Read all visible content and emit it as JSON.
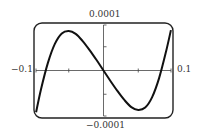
{
  "chart_data": {
    "type": "line",
    "title": "",
    "xlabel": "",
    "ylabel": "",
    "xlim": [
      -0.1,
      0.1
    ],
    "ylim": [
      -0.0001,
      0.0001
    ],
    "x_tick_labels": {
      "min": "−0.1",
      "max": "0.1"
    },
    "y_tick_labels": {
      "max": "0.0001",
      "min": "−0.0001"
    },
    "x_ticks": [
      -0.05,
      0.05
    ],
    "y_ticks": [
      -5e-05,
      5e-05
    ],
    "grid": false,
    "legend": null,
    "series": [
      {
        "name": "f(x)",
        "x": [
          -0.097,
          -0.09,
          -0.08,
          -0.07,
          -0.06,
          -0.05,
          -0.04,
          -0.03,
          -0.02,
          -0.01,
          0,
          0.01,
          0.02,
          0.03,
          0.04,
          0.05,
          0.06,
          0.07,
          0.08,
          0.09,
          0.097
        ],
        "y": [
          -8.8e-05,
          -4e-05,
          1.6e-05,
          5.6e-05,
          7.8e-05,
          8.3e-05,
          7.7e-05,
          6.2e-05,
          4.3e-05,
          2.2e-05,
          0,
          -2.2e-05,
          -4.3e-05,
          -6.2e-05,
          -7.7e-05,
          -8.3e-05,
          -7.8e-05,
          -5.6e-05,
          -1.6e-05,
          4e-05,
          8.5e-05
        ]
      }
    ]
  },
  "labels": {
    "top": "0.0001",
    "bottom": "−0.0001",
    "left": "−0.1",
    "right": "0.1"
  }
}
